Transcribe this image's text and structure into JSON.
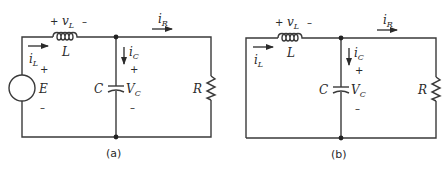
{
  "figure": {
    "circuits": [
      {
        "id": "a",
        "caption": "(a)",
        "has_source": true,
        "labels": {
          "inductor": "L",
          "inductor_voltage": "v",
          "inductor_voltage_sub": "L",
          "inductor_current": "i",
          "inductor_current_sub": "L",
          "capacitor": "C",
          "capacitor_voltage": "V",
          "capacitor_voltage_sub": "C",
          "capacitor_current": "i",
          "capacitor_current_sub": "C",
          "resistor": "R",
          "resistor_current": "i",
          "resistor_current_sub": "R",
          "source": "E",
          "plus": "+",
          "minus": "–"
        }
      },
      {
        "id": "b",
        "caption": "(b)",
        "has_source": false,
        "labels": {
          "inductor": "L",
          "inductor_voltage": "v",
          "inductor_voltage_sub": "L",
          "inductor_current": "i",
          "inductor_current_sub": "L",
          "capacitor": "C",
          "capacitor_voltage": "V",
          "capacitor_voltage_sub": "C",
          "capacitor_current": "i",
          "capacitor_current_sub": "C",
          "resistor": "R",
          "resistor_current": "i",
          "resistor_current_sub": "R",
          "plus": "+",
          "minus": "–"
        }
      }
    ],
    "colors": {
      "wire": "#3a3a3a",
      "text": "#2a2a2a",
      "background": "#ffffff"
    }
  }
}
